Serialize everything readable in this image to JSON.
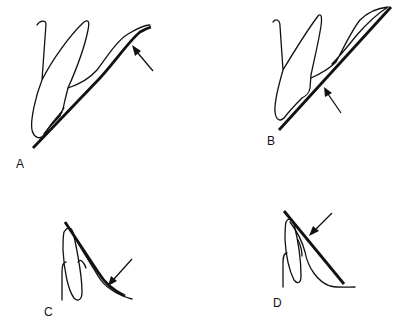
{
  "figure": {
    "colors": {
      "ink": "#111111",
      "background": "#ffffff"
    },
    "panels": [
      {
        "id": "A",
        "label": "A",
        "arrow": "pointing to upper curved end of straight edge"
      },
      {
        "id": "B",
        "label": "B",
        "arrow": "pointing to middle of straight edge"
      },
      {
        "id": "C",
        "label": "C",
        "arrow": "pointing to lower curved end of straight edge"
      },
      {
        "id": "D",
        "label": "D",
        "arrow": "pointing to upper end of straight edge"
      }
    ]
  }
}
